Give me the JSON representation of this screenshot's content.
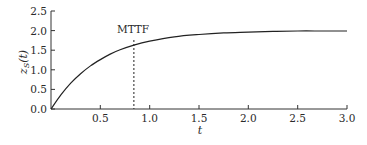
{
  "chart_data": {
    "type": "line",
    "title": "",
    "xlabel": "t",
    "ylabel": "z_S(t)",
    "xlim": [
      0,
      3.0
    ],
    "ylim": [
      0,
      2.5
    ],
    "x_ticks": [
      "0.5",
      "1.0",
      "1.5",
      "2.0",
      "2.5",
      "3.0"
    ],
    "y_ticks": [
      "0.0",
      "0.5",
      "1.0",
      "1.5",
      "2.0",
      "2.5"
    ],
    "grid": false,
    "legend": null,
    "series": [
      {
        "name": "z_S(t)",
        "x": [
          0,
          0.1,
          0.2,
          0.3,
          0.4,
          0.5,
          0.6,
          0.7,
          0.84,
          1.0,
          1.25,
          1.5,
          1.75,
          2.0,
          2.25,
          2.5,
          2.75,
          3.0
        ],
        "values": [
          0,
          0.36,
          0.66,
          0.9,
          1.1,
          1.26,
          1.4,
          1.51,
          1.63,
          1.73,
          1.84,
          1.9,
          1.94,
          1.96,
          1.98,
          1.99,
          1.99,
          1.99
        ]
      }
    ],
    "annotations": [
      {
        "text": "MTTF",
        "x": 0.84,
        "type": "vertical-dashed-line"
      }
    ]
  },
  "labels": {
    "xlabel": "t",
    "ylabel_main": "z",
    "ylabel_sub": "S",
    "ylabel_arg": "(t)",
    "mttf": "MTTF",
    "x_ticks": [
      "0.5",
      "1.0",
      "1.5",
      "2.0",
      "2.5",
      "3.0"
    ],
    "y_ticks": [
      "0.0",
      "0.5",
      "1.0",
      "1.5",
      "2.0",
      "2.5"
    ]
  }
}
